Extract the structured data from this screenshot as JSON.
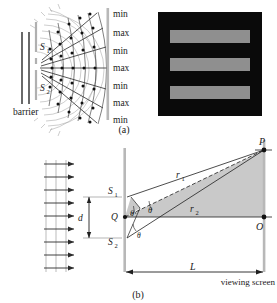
{
  "figure": {
    "panel_a": {
      "caption": "(a)",
      "barrier_label": "barrier",
      "slit_labels": [
        "S",
        "S"
      ],
      "slit_subscripts": [
        "1",
        "2"
      ],
      "screen_labels": [
        "min",
        "max",
        "min",
        "max",
        "min",
        "max",
        "min"
      ],
      "photo": {
        "description": "photograph of interference fringes",
        "fringe_count": 3,
        "background_color": "#0a0a0a",
        "fringe_color": "#8f8f8f"
      }
    },
    "panel_b": {
      "caption": "(b)",
      "slit_top_label": "S",
      "slit_top_sub": "1",
      "slit_bottom_label": "S",
      "slit_bottom_sub": "2",
      "midpoint_label": "Q",
      "separation_label": "d",
      "ray_top_label": "r",
      "ray_top_sub": "1",
      "ray_bottom_label": "r",
      "ray_bottom_sub": "2",
      "angle_labels": [
        "θ",
        "θ",
        "θ"
      ],
      "point_p_label": "P",
      "point_o_label": "O",
      "distance_label": "L",
      "screen_label": "viewing screen"
    }
  },
  "colors": {
    "ink": "#1a1a1a",
    "screen_bar": "#b8b8b8",
    "barrier": "#2a2a2a",
    "shade": "#c9c9c9",
    "wave_gray": "#9a9a9a",
    "photo_bg": "#0a0a0a",
    "photo_fringe": "#8f8f8f"
  }
}
